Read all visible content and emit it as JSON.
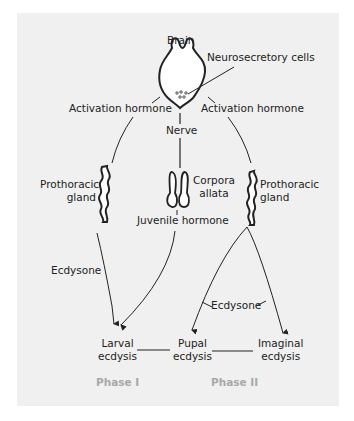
{
  "diagram": {
    "nodes": {
      "brain": "Brain",
      "neurosecretory_cells": "Neurosecretory cells",
      "activation_hormone_left": "Activation hormone",
      "activation_hormone_right": "Activation hormone",
      "nerve": "Nerve",
      "prothoracic_left_1": "Prothoracic",
      "prothoracic_left_2": "gland",
      "corpora_1": "Corpora",
      "corpora_2": "allata",
      "prothoracic_right_1": "Prothoracic",
      "prothoracic_right_2": "gland",
      "juvenile_hormone": "Juvenile hormone",
      "ecdysone_left": "Ecdysone",
      "ecdysone_right": "Ecdysone",
      "larval_1": "Larval",
      "larval_2": "ecdysis",
      "pupal_1": "Pupal",
      "pupal_2": "ecdysis",
      "imaginal_1": "Imaginal",
      "imaginal_2": "ecdysis"
    },
    "phases": {
      "phase1": "Phase I",
      "phase2": "Phase II"
    },
    "colors": {
      "panel": "#f0f0f0",
      "line": "#222222",
      "phase_text": "#a8a8a8"
    }
  }
}
